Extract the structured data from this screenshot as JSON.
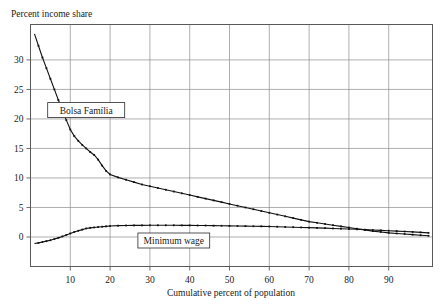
{
  "chart_data": {
    "type": "line",
    "title": "",
    "ylabel": "Percent income share",
    "xlabel": "Cumulative percent of population",
    "xlim": [
      0,
      101
    ],
    "ylim": [
      -5,
      36
    ],
    "grid": true,
    "legend_position": "inline-labels",
    "xticks": [
      10,
      20,
      30,
      40,
      50,
      60,
      70,
      80,
      90
    ],
    "xtick_labels": [
      "10",
      "20",
      "30",
      "40",
      "50",
      "60",
      "70",
      "80",
      "90"
    ],
    "yticks": [
      0,
      5,
      10,
      15,
      20,
      25,
      30
    ],
    "ytick_labels": [
      "0",
      "5",
      "10",
      "15",
      "20",
      "25",
      "30"
    ],
    "annotations": [
      {
        "name": "bolsa-familia-label",
        "text": "Bolsa Família",
        "x": 14,
        "y": 21.5
      },
      {
        "name": "minimum-wage-label",
        "text": "Minimum wage",
        "x": 36,
        "y": -0.6
      }
    ],
    "series": [
      {
        "name": "Bolsa Família",
        "marker": "square",
        "x": [
          1,
          2,
          3,
          4,
          5,
          6,
          7,
          8,
          9,
          10,
          11,
          12,
          13,
          14,
          15,
          16,
          17,
          18,
          19,
          20,
          22,
          24,
          26,
          28,
          30,
          32,
          34,
          36,
          38,
          40,
          42,
          44,
          46,
          48,
          50,
          52,
          54,
          56,
          58,
          60,
          62,
          64,
          66,
          68,
          70,
          72,
          74,
          76,
          78,
          80,
          82,
          84,
          86,
          88,
          90,
          92,
          94,
          96,
          98,
          100
        ],
        "values": [
          34.4,
          32.4,
          30.4,
          28.6,
          26.8,
          25.0,
          23.2,
          21.5,
          19.8,
          18.2,
          17.1,
          16.3,
          15.6,
          15.0,
          14.4,
          13.9,
          13.1,
          12.1,
          11.2,
          10.6,
          10.1,
          9.7,
          9.3,
          8.9,
          8.6,
          8.3,
          8.0,
          7.7,
          7.4,
          7.1,
          6.8,
          6.5,
          6.2,
          5.9,
          5.6,
          5.3,
          5.0,
          4.7,
          4.4,
          4.1,
          3.8,
          3.5,
          3.2,
          2.9,
          2.6,
          2.4,
          2.2,
          2.0,
          1.8,
          1.6,
          1.4,
          1.2,
          1.0,
          0.85,
          0.7,
          0.6,
          0.5,
          0.4,
          0.3,
          0.2
        ]
      },
      {
        "name": "Minimum wage",
        "marker": "square",
        "x": [
          1,
          2,
          3,
          4,
          5,
          6,
          7,
          8,
          9,
          10,
          11,
          12,
          13,
          14,
          15,
          16,
          17,
          18,
          19,
          20,
          22,
          24,
          26,
          28,
          30,
          32,
          34,
          36,
          38,
          40,
          42,
          44,
          46,
          48,
          50,
          52,
          54,
          56,
          58,
          60,
          62,
          64,
          66,
          68,
          70,
          72,
          74,
          76,
          78,
          80,
          82,
          84,
          86,
          88,
          90,
          92,
          94,
          96,
          98,
          100
        ],
        "values": [
          -1.1,
          -1.0,
          -0.85,
          -0.7,
          -0.55,
          -0.35,
          -0.15,
          0.1,
          0.35,
          0.6,
          0.85,
          1.05,
          1.25,
          1.45,
          1.55,
          1.62,
          1.68,
          1.74,
          1.8,
          1.86,
          1.92,
          1.95,
          1.96,
          1.97,
          1.98,
          1.98,
          1.98,
          1.98,
          1.97,
          1.96,
          1.95,
          1.94,
          1.92,
          1.9,
          1.88,
          1.86,
          1.84,
          1.82,
          1.8,
          1.78,
          1.74,
          1.7,
          1.66,
          1.62,
          1.58,
          1.54,
          1.5,
          1.45,
          1.4,
          1.35,
          1.3,
          1.24,
          1.18,
          1.12,
          1.06,
          1.0,
          0.93,
          0.86,
          0.78,
          0.7
        ]
      }
    ]
  },
  "style": {
    "curve_color": "#111111",
    "grid_color": "#8d8d8d",
    "frame_color": "#5a5a5a",
    "background": "#ffffff"
  }
}
